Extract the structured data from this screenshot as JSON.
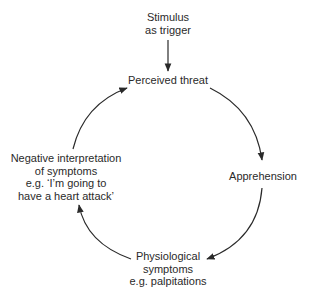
{
  "diagram": {
    "type": "cycle",
    "trigger": {
      "lines": [
        "Stimulus",
        "as trigger"
      ]
    },
    "nodes": [
      {
        "id": "perceived-threat",
        "lines": [
          "Perceived threat"
        ]
      },
      {
        "id": "apprehension",
        "lines": [
          "Apprehension"
        ]
      },
      {
        "id": "physiological-symptoms",
        "lines": [
          "Physiological",
          "symptoms",
          "e.g. palpitations"
        ]
      },
      {
        "id": "negative-interpretation",
        "lines": [
          "Negative interpretation",
          "of symptoms",
          "e.g. ‘I’m going to",
          "have a heart attack’"
        ]
      }
    ],
    "edges": [
      {
        "from": "trigger",
        "to": "perceived-threat"
      },
      {
        "from": "perceived-threat",
        "to": "apprehension"
      },
      {
        "from": "apprehension",
        "to": "physiological-symptoms"
      },
      {
        "from": "physiological-symptoms",
        "to": "negative-interpretation"
      },
      {
        "from": "negative-interpretation",
        "to": "perceived-threat"
      }
    ],
    "colors": {
      "line": "#2a2a2a",
      "text": "#2a2a2a",
      "background": "#ffffff"
    }
  }
}
